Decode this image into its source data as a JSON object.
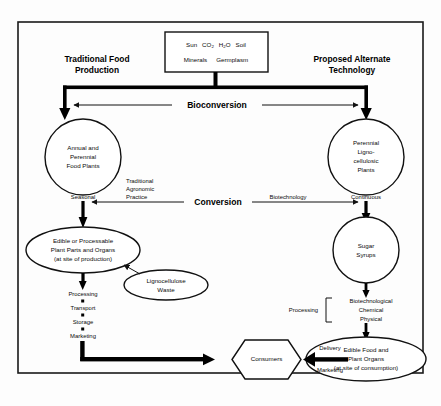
{
  "diagram": {
    "title_left": "Traditional Food Production",
    "title_left_line1": "Traditional Food",
    "title_left_line2": "Production",
    "title_right_line1": "Proposed Alternate",
    "title_right_line2": "Technology",
    "inputs_box": {
      "line1_items": [
        "Sun",
        "CO",
        "H",
        "O",
        "Soil"
      ],
      "line1_text": "Sun  CO2  H2O  Soil",
      "line1_part_sun": "Sun",
      "line1_part_co": "CO",
      "line1_part_co_sub": "2",
      "line1_part_h": "H",
      "line1_part_h_sub": "2",
      "line1_part_o": "O",
      "line1_part_soil": "Soil",
      "line2_text": "Minerals    Germplasm",
      "line2_part_minerals": "Minerals",
      "line2_part_germplasm": "Germplasm"
    },
    "bioconversion_label": "Bioconversion",
    "conversion_label": "Conversion",
    "nodes": {
      "annual_perennial": {
        "line1": "Annual and",
        "line2": "Perennial",
        "line3": "Food Plants"
      },
      "perennial_ligno": {
        "line1": "Perennial",
        "line2": "Ligno-",
        "line3": "cellulosic",
        "line4": "Plants"
      },
      "edible_processable": {
        "line1": "Edible or Processable",
        "line2": "Plant Parts and Organs",
        "line3": "(at site of production)"
      },
      "lignocellulose_waste": {
        "line1": "Lignocellulose",
        "line2": "Waste"
      },
      "sugar_syrups": {
        "line1": "Sugar",
        "line2": "Syrups"
      },
      "edible_food_organs": {
        "line1": "Edible Food and",
        "line2": "Plant Organs",
        "line3": "(at site of consumption)"
      },
      "consumers": {
        "label": "Consumers"
      }
    },
    "edge_labels": {
      "seasonal": "Seasonal",
      "continuous": "Continuous",
      "traditional_agronomic_practice": {
        "line1": "Traditional",
        "line2": "Agronomic",
        "line3": "Practice"
      },
      "biotechnology": "Biotechnology",
      "delivery": "Delivery",
      "marketing_edge": "Marketing",
      "processing_bracket_label": "Processing"
    },
    "left_process_chain": [
      "Processing",
      "Transport",
      "Storage",
      "Marketing"
    ],
    "right_process_bracket": [
      "Biotechnological",
      "Chemical",
      "Physical"
    ],
    "colors": {
      "ink": "#111111",
      "paper": "#ffffff",
      "frame": "#1a1a1a"
    }
  }
}
